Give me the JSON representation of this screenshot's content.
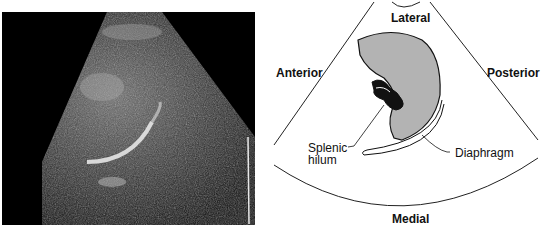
{
  "figure": {
    "left_panel": {
      "type": "ultrasound-image",
      "description": "Grayscale sonogram of the spleen"
    },
    "right_panel": {
      "type": "labeled-schematic",
      "orientation_labels": {
        "top": "Lateral",
        "left": "Anterior",
        "right": "Posterior",
        "bottom": "Medial"
      },
      "structure_labels": {
        "hilum_line1": "Splenic",
        "hilum_line2": "hilum",
        "diaphragm": "Diaphragm"
      },
      "colors": {
        "spleen_fill": "#b3b3b3",
        "outline": "#111111",
        "vessel_fill": "#111111"
      }
    }
  }
}
